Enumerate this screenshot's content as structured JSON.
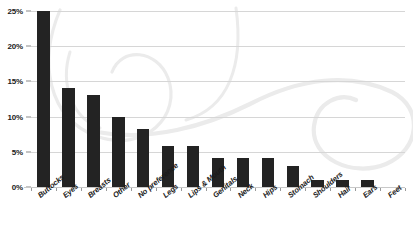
{
  "chart_data": {
    "type": "bar",
    "title": "",
    "subtitle": "",
    "xlabel": "",
    "ylabel": "",
    "ylim": [
      0,
      25
    ],
    "y_ticks": [
      "0%",
      "5%",
      "10%",
      "15%",
      "20%",
      "25%"
    ],
    "y_tick_values": [
      0,
      5,
      10,
      15,
      20,
      25
    ],
    "grid": true,
    "legend": "none",
    "orientation": "vertical",
    "categories": [
      "Buttocks",
      "Eyes",
      "Breasts",
      "Other",
      "No preference",
      "Legs",
      "Lips & Mouth",
      "Genitals",
      "Neck",
      "Hips",
      "Stomach",
      "Shoulders",
      "Hair",
      "Ears",
      "Feet"
    ],
    "values": [
      25.0,
      14.0,
      13.0,
      10.0,
      8.3,
      5.8,
      5.8,
      4.1,
      4.1,
      4.1,
      3.0,
      1.0,
      1.0,
      1.0,
      0.0
    ],
    "value_labels": [
      "25%",
      "14%",
      "13%",
      "10%",
      "8.3%",
      "5.8%",
      "5.8%",
      "4.1%",
      "4.1%",
      "4.1%",
      "3%",
      "1%",
      "1%",
      "1%",
      "0%"
    ],
    "bar_color": "#232323",
    "gridline_color": "#d6d6d6",
    "axis_color": "#c8c8c8",
    "background_color": "#ffffff",
    "watermark_color": "#ebebeb"
  }
}
